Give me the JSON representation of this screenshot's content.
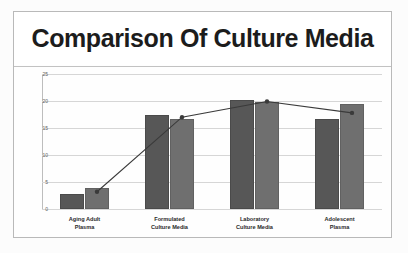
{
  "chart_data": {
    "type": "bar",
    "title": "Comparison Of Culture Media",
    "xlabel": "",
    "ylabel": "",
    "ylim": [
      0,
      25
    ],
    "yticks": [
      0,
      5,
      10,
      15,
      20,
      25
    ],
    "ytick_labels": [
      "0",
      "5",
      "10",
      "15",
      "20",
      "25"
    ],
    "grid": true,
    "legend": "none",
    "categories": [
      "Aging Adult Plasma",
      "Formulated Culture Media",
      "Laboratory Culture Media",
      "Adolescent Plasma"
    ],
    "category_lines": [
      [
        "Aging Adult",
        "Plasma"
      ],
      [
        "Formulated",
        "Culture Media"
      ],
      [
        "Laboratory",
        "Culture Media"
      ],
      [
        "Adolescent",
        "Plasma"
      ]
    ],
    "series": [
      {
        "name": "Series 1",
        "color": "#575757",
        "values": [
          2.8,
          17.5,
          20.2,
          16.6
        ]
      },
      {
        "name": "Series 2",
        "color": "#6f6f6f",
        "values": [
          3.9,
          16.6,
          19.8,
          19.4
        ]
      }
    ],
    "overlay_line": {
      "name": "Trend",
      "color": "#3a3a3a",
      "marker": "circle",
      "values": [
        3.2,
        17.0,
        19.9,
        17.8
      ]
    }
  },
  "frame": {
    "border_color": "#b9b9b9",
    "background": "#fefefe"
  }
}
